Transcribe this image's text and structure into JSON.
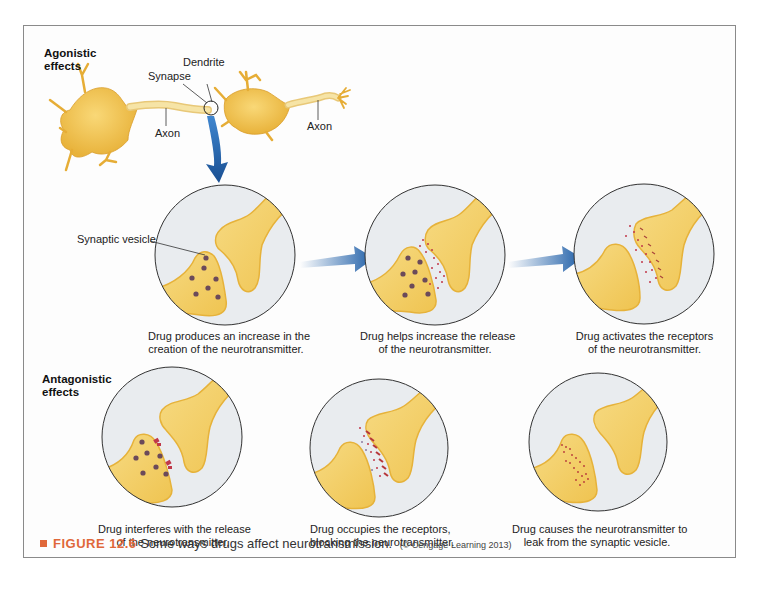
{
  "figure": {
    "number_label": "FIGURE 12.6",
    "caption": "Some ways drugs affect neurotransmission.",
    "credit": "(© Cengage Learning 2013)",
    "accent_color": "#e0683a"
  },
  "agonistic": {
    "title_line1": "Agonistic",
    "title_line2": "effects",
    "neuron_labels": {
      "dendrite": "Dendrite",
      "synapse": "Synapse",
      "axon_left": "Axon",
      "axon_right": "Axon"
    },
    "vesicle_label": "Synaptic vesicle",
    "panels": [
      {
        "line1": "Drug produces an increase in the",
        "line2": "creation of the neurotransmitter."
      },
      {
        "line1": "Drug helps increase the release",
        "line2": "of the neurotransmitter."
      },
      {
        "line1": "Drug activates the receptors",
        "line2": "of the neurotransmitter."
      }
    ]
  },
  "antagonistic": {
    "title_line1": "Antagonistic",
    "title_line2": "effects",
    "panels": [
      {
        "line1": "Drug interferes with the release",
        "line2": "of the neurotransmitter."
      },
      {
        "line1": "Drug occupies the receptors,",
        "line2": "blocking the neurotransmitter."
      },
      {
        "line1": "Drug causes the neurotransmitter to",
        "line2": "leak from the synaptic vesicle."
      }
    ]
  },
  "colors": {
    "neuron_fill": "#f2c94c",
    "neuron_edge": "#e0a92a",
    "circle_bg": "#e9ecef",
    "vesicle": "#6b4a5a",
    "neurotransmitter": "#c0394a",
    "arrow_blue": "#1f5fa8"
  }
}
